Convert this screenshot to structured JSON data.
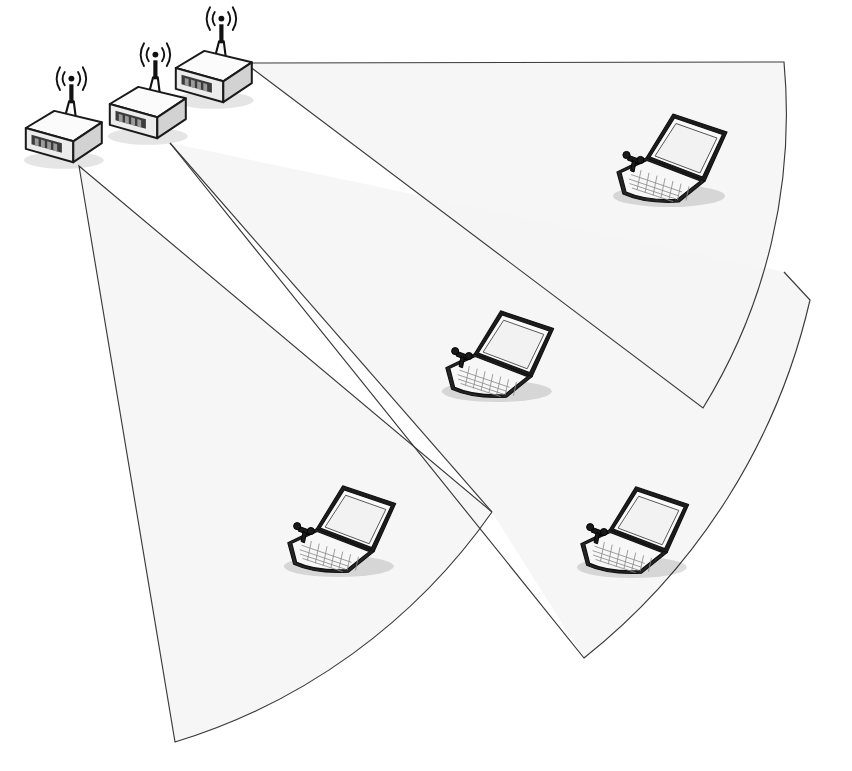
{
  "canvas": {
    "width": 852,
    "height": 771,
    "background": "#ffffff"
  },
  "diagram": {
    "type": "network-coverage-diagram",
    "colors": {
      "sector_fill": "#f4f4f4",
      "sector_outline": "#3a3a3a",
      "device_outline": "#111111",
      "device_body_light": "#fbfbfb",
      "device_body_mid": "#ececec",
      "device_body_dark": "#d2d2d2",
      "led": "#3c3c3c",
      "shadow": "rgba(0,0,0,0.12)"
    },
    "counts": {
      "access_points": 3,
      "laptops": 4,
      "coverage_sectors": 3
    }
  },
  "access_points": [
    {
      "id": "ap-1",
      "label": "Access Point 1",
      "icon": "wireless-access-point-icon",
      "x": 60,
      "y": 150,
      "scale": 1.0,
      "antenna_waves": 3,
      "serves_sector": "sector-left"
    },
    {
      "id": "ap-2",
      "label": "Access Point 2",
      "icon": "wireless-access-point-icon",
      "x": 144,
      "y": 126,
      "scale": 1.0,
      "antenna_waves": 3,
      "serves_sector": "sector-middle"
    },
    {
      "id": "ap-3",
      "label": "Access Point 3",
      "icon": "wireless-access-point-icon",
      "x": 210,
      "y": 90,
      "scale": 1.0,
      "antenna_waves": 3,
      "serves_sector": "sector-right"
    }
  ],
  "laptops": [
    {
      "id": "laptop-1",
      "label": "Wireless Client 1",
      "icon": "laptop-icon",
      "x": 669,
      "y": 155,
      "scale": 1.0,
      "in_sector": "sector-right"
    },
    {
      "id": "laptop-2",
      "label": "Wireless Client 2",
      "icon": "laptop-icon",
      "x": 498,
      "y": 352,
      "scale": 0.98,
      "in_sector": "sector-middle"
    },
    {
      "id": "laptop-3",
      "label": "Wireless Client 3",
      "icon": "laptop-icon",
      "x": 340,
      "y": 527,
      "scale": 0.98,
      "in_sector": "sector-left"
    },
    {
      "id": "laptop-4",
      "label": "Wireless Client 4",
      "icon": "laptop-icon",
      "x": 633,
      "y": 528,
      "scale": 0.98,
      "in_sector": "sector-middle"
    }
  ],
  "sectors": [
    {
      "id": "sector-left",
      "label": "Coverage Sector A",
      "source_ap": "ap-1",
      "apex": [
        79,
        166
      ],
      "edge_a_end": [
        175,
        742
      ],
      "edge_b_end": [
        492,
        512
      ],
      "arc_radius": 600,
      "fill": "#f4f4f4"
    },
    {
      "id": "sector-middle",
      "label": "Coverage Sector B",
      "source_ap": "ap-2",
      "apex": [
        170,
        143
      ],
      "edge_a_end": [
        492,
        512
      ],
      "edge_b_end": [
        784,
        272
      ],
      "arc_radius": 640,
      "fill": "#f4f4f4"
    },
    {
      "id": "sector-right",
      "label": "Coverage Sector C",
      "source_ap": "ap-3",
      "apex": [
        245,
        63
      ],
      "edge_a_end": [
        784,
        62
      ],
      "edge_b_end": [
        703,
        408
      ],
      "arc_radius": 560,
      "fill": "#f4f4f4"
    }
  ]
}
